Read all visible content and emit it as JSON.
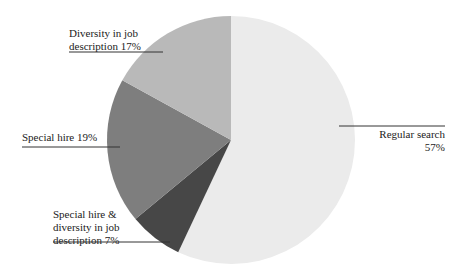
{
  "chart_data": {
    "type": "pie",
    "title": "",
    "start_angle_deg": 0,
    "direction": "clockwise",
    "slices": [
      {
        "label": "Regular search",
        "value": 57,
        "color": "#ebebeb"
      },
      {
        "label": "Special hire & diversity in job description",
        "value": 7,
        "color": "#474747"
      },
      {
        "label": "Special hire",
        "value": 19,
        "color": "#7e7e7e"
      },
      {
        "label": "Diversity in job description",
        "value": 17,
        "color": "#b9b9b9"
      }
    ],
    "labels": [
      {
        "lines": [
          "Regular search",
          "57%"
        ],
        "anchor": "end",
        "x": 445,
        "y": 138,
        "line": [
          339,
          126,
          445,
          126
        ]
      },
      {
        "lines": [
          "Special hire &",
          "diversity in job",
          "description 7%"
        ],
        "anchor": "start",
        "x": 53,
        "y": 218,
        "line": [
          53,
          242,
          170,
          242
        ]
      },
      {
        "lines": [
          "Special hire 19%"
        ],
        "anchor": "start",
        "x": 22,
        "y": 141,
        "line": [
          22,
          147,
          120,
          147
        ]
      },
      {
        "lines": [
          "Diversity in job",
          "description 17%"
        ],
        "anchor": "start",
        "x": 69,
        "y": 37,
        "line": [
          69,
          52,
          163,
          52
        ]
      }
    ],
    "legend": "none",
    "center": [
      231,
      140
    ],
    "radius": 124
  }
}
